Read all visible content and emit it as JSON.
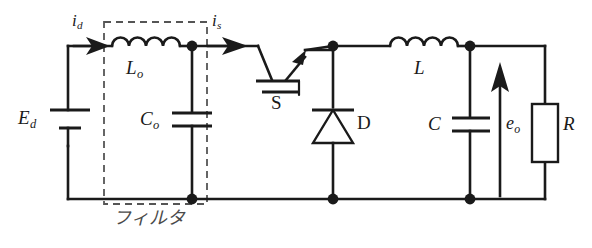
{
  "diagram": {
    "type": "electrical-schematic",
    "colors": {
      "wire": "#1a1a1a",
      "dashed_box": "#555555",
      "background": "#ffffff"
    }
  },
  "labels": {
    "source_voltage": {
      "base": "E",
      "sub": "d"
    },
    "filter_inductor": {
      "base": "L",
      "sub": "o"
    },
    "filter_capacitor": {
      "base": "C",
      "sub": "o"
    },
    "input_current": {
      "base": "i",
      "sub": "d"
    },
    "switch_current": {
      "base": "i",
      "sub": "s"
    },
    "switch": {
      "base": "S",
      "sub": ""
    },
    "diode": {
      "base": "D",
      "sub": ""
    },
    "main_inductor": {
      "base": "L",
      "sub": ""
    },
    "output_capacitor": {
      "base": "C",
      "sub": ""
    },
    "output_voltage": {
      "base": "e",
      "sub": "o"
    },
    "load_resistor": {
      "base": "R",
      "sub": ""
    },
    "filter_box_caption": "フィルタ"
  },
  "components": [
    {
      "name": "dc-source",
      "symbol": "battery",
      "label": "Ed"
    },
    {
      "name": "filter-inductor",
      "symbol": "inductor",
      "label": "Lo",
      "turns": 4
    },
    {
      "name": "filter-capacitor",
      "symbol": "capacitor",
      "label": "Co"
    },
    {
      "name": "switch",
      "symbol": "transistor-switch",
      "label": "S"
    },
    {
      "name": "freewheel-diode",
      "symbol": "diode",
      "label": "D",
      "orientation": "cathode-up"
    },
    {
      "name": "main-inductor",
      "symbol": "inductor",
      "label": "L",
      "turns": 4
    },
    {
      "name": "output-capacitor",
      "symbol": "capacitor",
      "label": "C"
    },
    {
      "name": "load-resistor",
      "symbol": "resistor-box",
      "label": "R"
    }
  ],
  "annotations": [
    {
      "name": "input-current-arrow",
      "label": "id",
      "direction": "right"
    },
    {
      "name": "switch-current-arrow",
      "label": "is",
      "direction": "right"
    },
    {
      "name": "output-voltage-arrow",
      "label": "eo",
      "direction": "up"
    }
  ],
  "groups": [
    {
      "name": "filter-group",
      "caption": "フィルタ",
      "style": "dashed"
    }
  ]
}
